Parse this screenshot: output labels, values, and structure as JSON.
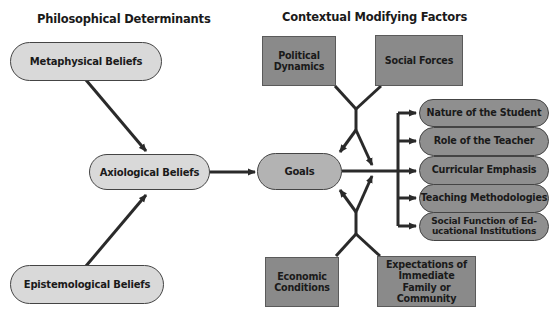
{
  "headings": {
    "left": "Philosophical Determinants",
    "right": "Contextual Modifying Factors"
  },
  "philosophical": {
    "metaphysical": "Metaphysical Beliefs",
    "axiological": "Axiological Beliefs",
    "epistemological": "Epistemological Beliefs"
  },
  "goals": "Goals",
  "factors": {
    "political": "Political Dynamics",
    "social": "Social Forces",
    "economic": "Economic Conditions",
    "expectations": "Expectations of Immediate Family or Community"
  },
  "outcomes": [
    "Nature of the Student",
    "Role of the Teacher",
    "Curricular Emphasis",
    "Teaching Methodologies",
    "Social Function of Ed-ucational Institutions"
  ],
  "colors": {
    "light_pill": "#d9d9d9",
    "goals_pill": "#b3b3b3",
    "dark_box": "#8a8a8a",
    "arrow": "#2a2a2a"
  }
}
